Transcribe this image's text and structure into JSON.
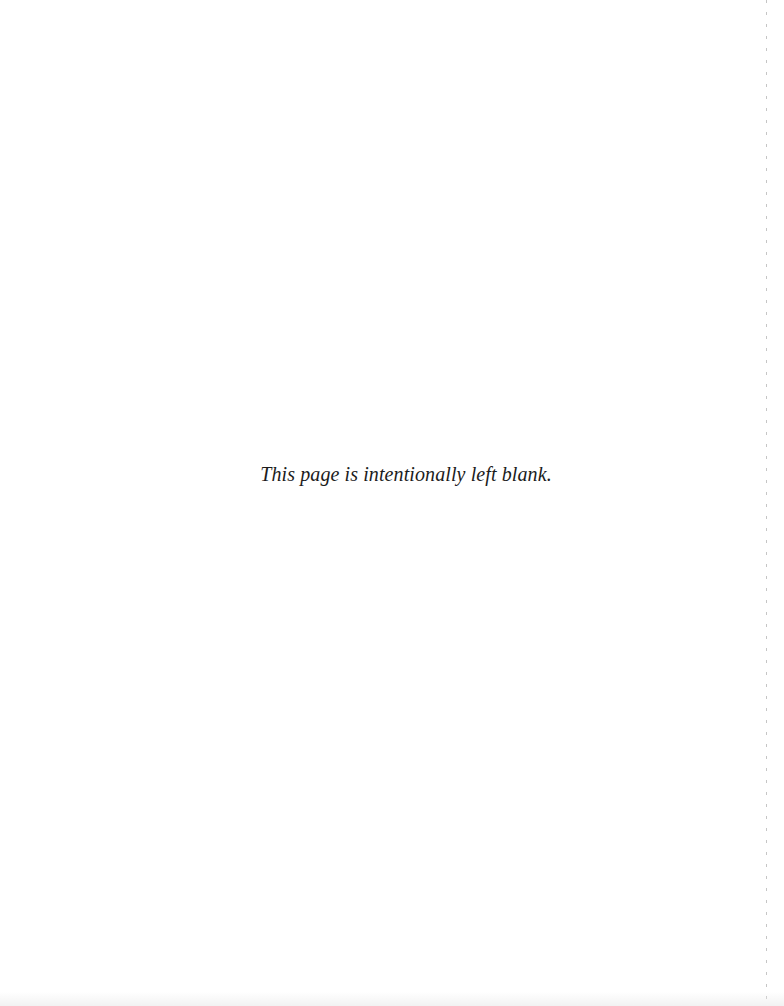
{
  "document": {
    "notice_text": "This page is intentionally left blank.",
    "background_color": "#ffffff",
    "text_color": "#1c1c1c"
  }
}
